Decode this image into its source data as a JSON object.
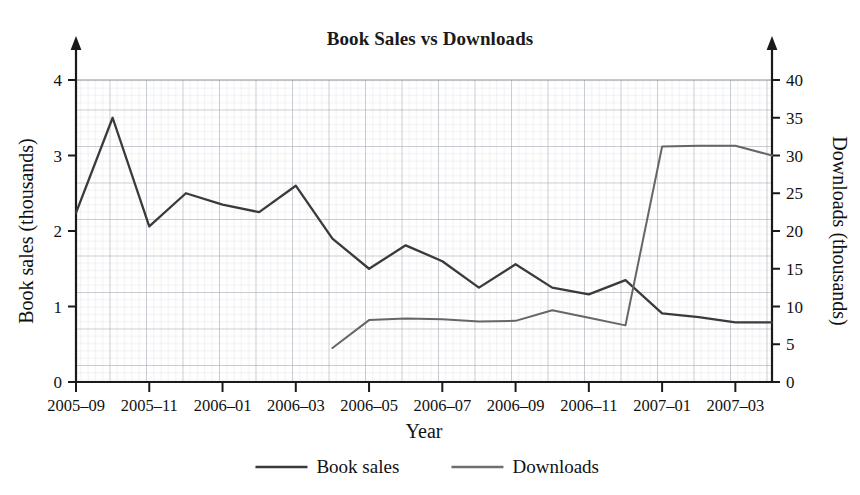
{
  "chart_data": {
    "type": "line",
    "title": "Book Sales vs Downloads",
    "xlabel": "Year",
    "ylabel": "Book sales (thousands)",
    "y2label": "Downloads (thousands)",
    "grid": "graph-paper",
    "legend_position": "bottom-center",
    "x": [
      "2005-09",
      "2005-10",
      "2005-11",
      "2005-12",
      "2006-01",
      "2006-02",
      "2006-03",
      "2006-04",
      "2006-05",
      "2006-06",
      "2006-07",
      "2006-08",
      "2006-09",
      "2006-10",
      "2006-11",
      "2006-12",
      "2007-01",
      "2007-02",
      "2007-03",
      "2007-04"
    ],
    "xtick_labels": [
      "2005–09",
      "2005–11",
      "2006–01",
      "2006–03",
      "2006–05",
      "2006–07",
      "2006–09",
      "2006–11",
      "2007–01",
      "2007–03"
    ],
    "xtick_values": [
      "2005-09",
      "2005-11",
      "2006-01",
      "2006-03",
      "2006-05",
      "2006-07",
      "2006-09",
      "2006-11",
      "2007-01",
      "2007-03"
    ],
    "ylim": [
      0,
      4
    ],
    "ytick_labels": [
      "0",
      "1",
      "2",
      "3",
      "4"
    ],
    "ytick_values": [
      0,
      1,
      2,
      3,
      4
    ],
    "y2lim": [
      0,
      40
    ],
    "y2tick_labels": [
      "0",
      "5",
      "10",
      "15",
      "20",
      "25",
      "30",
      "35",
      "40"
    ],
    "y2tick_values": [
      0,
      5,
      10,
      15,
      20,
      25,
      30,
      35,
      40
    ],
    "series": [
      {
        "name": "Book sales",
        "axis": "left",
        "color": "#3a3a3a",
        "units": "thousands",
        "x": [
          "2005-09",
          "2005-10",
          "2005-11",
          "2005-12",
          "2006-01",
          "2006-02",
          "2006-03",
          "2006-04",
          "2006-05",
          "2006-06",
          "2006-07",
          "2006-08",
          "2006-09",
          "2006-10",
          "2006-11",
          "2006-12",
          "2007-01",
          "2007-02",
          "2007-03",
          "2007-04"
        ],
        "values": [
          2.24,
          3.5,
          2.06,
          2.5,
          2.35,
          2.25,
          2.6,
          1.9,
          1.5,
          1.81,
          1.6,
          1.25,
          1.56,
          1.25,
          1.16,
          1.35,
          0.91,
          0.86,
          0.79,
          0.79
        ]
      },
      {
        "name": "Downloads",
        "axis": "right",
        "color": "#666666",
        "units": "thousands",
        "x": [
          "2006-04",
          "2006-05",
          "2006-06",
          "2006-07",
          "2006-08",
          "2006-09",
          "2006-10",
          "2006-11",
          "2006-12",
          "2007-01",
          "2007-02",
          "2007-03",
          "2007-04"
        ],
        "values": [
          4.5,
          8.2,
          8.4,
          8.3,
          8.0,
          8.1,
          9.5,
          8.5,
          7.5,
          31.2,
          31.3,
          31.3,
          30.0
        ]
      }
    ],
    "legend": [
      {
        "label": "Book sales",
        "color": "#3a3a3a"
      },
      {
        "label": "Downloads",
        "color": "#6e6e6e"
      }
    ]
  }
}
